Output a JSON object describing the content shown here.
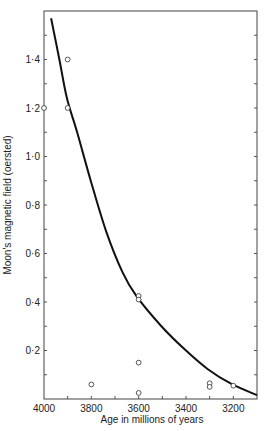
{
  "chart_data": {
    "type": "scatter",
    "title": "",
    "xlabel": "Age in millions of years",
    "ylabel": "Moon's magnetic field (oersted)",
    "xlim": [
      4000,
      3100
    ],
    "ylim": [
      0,
      1.6
    ],
    "x_reversed": true,
    "grid": false,
    "legend": null,
    "x_ticks": [
      4000,
      3800,
      3600,
      3400,
      3200
    ],
    "x_tick_labels": [
      "4000",
      "3800",
      "3600",
      "3400",
      "3200"
    ],
    "x_minor_ticks": [
      3900,
      3700,
      3500,
      3300
    ],
    "y_ticks": [
      0.2,
      0.4,
      0.6,
      0.8,
      1.0,
      1.2,
      1.4
    ],
    "y_tick_labels": [
      "0·2",
      "0·4",
      "0·6",
      "0·8",
      "1·0",
      "1·2",
      "1·4"
    ],
    "y_minor_ticks": [
      0.1,
      0.3,
      0.5,
      0.7,
      0.9,
      1.1,
      1.3,
      1.5
    ],
    "series": [
      {
        "name": "Measurements",
        "type": "scatter",
        "marker": "open-circle",
        "points": [
          {
            "x": 4000,
            "y": 1.2
          },
          {
            "x": 3900,
            "y": 1.4
          },
          {
            "x": 3900,
            "y": 1.2
          },
          {
            "x": 3800,
            "y": 0.06
          },
          {
            "x": 3600,
            "y": 0.425
          },
          {
            "x": 3600,
            "y": 0.41
          },
          {
            "x": 3600,
            "y": 0.15
          },
          {
            "x": 3600,
            "y": 0.025
          },
          {
            "x": 3300,
            "y": 0.065
          },
          {
            "x": 3300,
            "y": 0.05
          },
          {
            "x": 3200,
            "y": 0.055
          }
        ]
      },
      {
        "name": "Fitted curve",
        "type": "line",
        "points": [
          {
            "x": 3970,
            "y": 1.57
          },
          {
            "x": 3935,
            "y": 1.4
          },
          {
            "x": 3903,
            "y": 1.24
          },
          {
            "x": 3860,
            "y": 1.1
          },
          {
            "x": 3801,
            "y": 0.895
          },
          {
            "x": 3737,
            "y": 0.69
          },
          {
            "x": 3669,
            "y": 0.524
          },
          {
            "x": 3610,
            "y": 0.425
          },
          {
            "x": 3504,
            "y": 0.3
          },
          {
            "x": 3407,
            "y": 0.206
          },
          {
            "x": 3309,
            "y": 0.124
          },
          {
            "x": 3208,
            "y": 0.062
          },
          {
            "x": 3100,
            "y": 0.016
          }
        ]
      }
    ]
  },
  "layout": {
    "plot_left": 44,
    "plot_right": 257,
    "plot_top": 11,
    "plot_bottom": 399,
    "colors": {
      "line": "#111111",
      "axis": "#555555",
      "marker": "#444444"
    }
  }
}
